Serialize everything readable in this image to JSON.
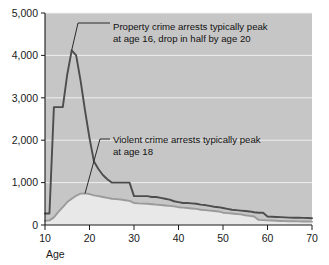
{
  "chart_data": {
    "type": "line",
    "title": "",
    "subtitle": "",
    "xlabel": "Age",
    "ylabel": "",
    "xlim": [
      10,
      70
    ],
    "ylim": [
      0,
      5000
    ],
    "grid": true,
    "grid_axis": "y",
    "legend": "none",
    "x_ticks": [
      "10",
      "20",
      "30",
      "40",
      "50",
      "60",
      "70"
    ],
    "x_tick_values": [
      10,
      20,
      30,
      40,
      50,
      60,
      70
    ],
    "y_ticks": [
      "0",
      "1,000",
      "2,000",
      "3,000",
      "4,000",
      "5,000"
    ],
    "y_tick_values": [
      0,
      1000,
      2000,
      3000,
      4000,
      5000
    ],
    "x": [
      10,
      11,
      12,
      13,
      14,
      15,
      16,
      17,
      18,
      19,
      20,
      21,
      22,
      23,
      24,
      25,
      26,
      27,
      28,
      29,
      30,
      31,
      32,
      33,
      34,
      35,
      36,
      37,
      38,
      39,
      40,
      41,
      42,
      43,
      44,
      45,
      46,
      47,
      48,
      49,
      50,
      51,
      52,
      53,
      54,
      55,
      56,
      57,
      58,
      59,
      60,
      61,
      62,
      63,
      64,
      65,
      66,
      67,
      68,
      69,
      70
    ],
    "series": [
      {
        "name": "Property crime arrests",
        "color": "#4d4d4d",
        "values": [
          270,
          270,
          2780,
          2780,
          2780,
          3550,
          4120,
          4000,
          3400,
          2700,
          2050,
          1500,
          1320,
          1180,
          1080,
          1000,
          1000,
          1000,
          1000,
          1000,
          680,
          680,
          680,
          680,
          660,
          660,
          640,
          620,
          600,
          560,
          540,
          520,
          520,
          510,
          500,
          480,
          470,
          450,
          430,
          420,
          400,
          380,
          360,
          350,
          340,
          330,
          320,
          300,
          290,
          290,
          200,
          195,
          190,
          185,
          180,
          175,
          172,
          170,
          168,
          165,
          160
        ]
      },
      {
        "name": "Violent crime arrests",
        "color": "#9a9a9a",
        "values": [
          100,
          110,
          180,
          310,
          420,
          540,
          620,
          690,
          740,
          745,
          730,
          700,
          680,
          660,
          640,
          620,
          610,
          600,
          585,
          570,
          520,
          510,
          505,
          500,
          490,
          480,
          470,
          460,
          450,
          440,
          420,
          410,
          400,
          390,
          380,
          360,
          350,
          340,
          330,
          320,
          290,
          280,
          270,
          260,
          250,
          230,
          215,
          200,
          120,
          115,
          110,
          105,
          100,
          95,
          92,
          90,
          88,
          86,
          84,
          82,
          80
        ]
      }
    ],
    "annotations": [
      {
        "id": "property-annotation",
        "line1": "Property crime arrests typically peak",
        "line2": "at age 16, drop in half by age 20",
        "points_to_age": 16,
        "points_to_value": 4120
      },
      {
        "id": "violent-annotation",
        "line1": "Violent crime arrests typically peak",
        "line2": "at age 18",
        "points_to_age": 19,
        "points_to_value": 745
      }
    ],
    "colors": {
      "plot_background": "#c6c6c6",
      "under_violent_fill": "#e8e8e8",
      "gridline": "#efefef",
      "axis": "#1a1a1a",
      "page_background": "#ffffff",
      "property_line": "#4d4d4d",
      "violent_line": "#9a9a9a",
      "leader_line": "#2b2b2b"
    }
  }
}
